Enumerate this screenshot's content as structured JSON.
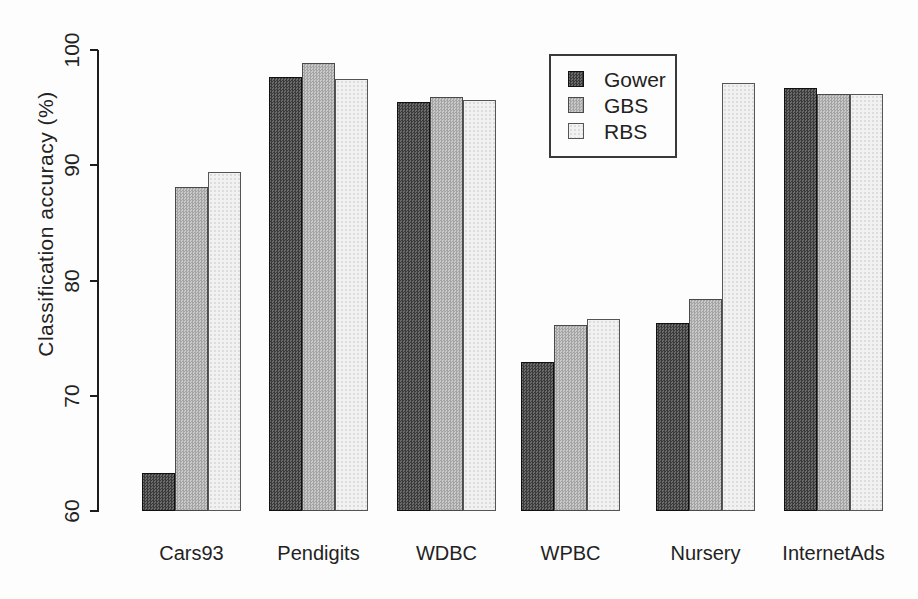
{
  "chart_data": {
    "type": "bar",
    "title": "",
    "xlabel": "",
    "ylabel": "Classification accuracy (%)",
    "ylim": [
      60,
      100
    ],
    "yticks": [
      60,
      70,
      80,
      90,
      100
    ],
    "grid": false,
    "legend_position": "top-right-inside",
    "categories": [
      "Cars93",
      "Pendigits",
      "WDBC",
      "WPBC",
      "Nursery",
      "InternetAds"
    ],
    "series": [
      {
        "name": "Gower",
        "values": [
          63.3,
          97.7,
          95.5,
          72.9,
          76.3,
          96.7
        ]
      },
      {
        "name": "GBS",
        "values": [
          88.1,
          98.9,
          95.9,
          76.1,
          78.4,
          96.2
        ]
      },
      {
        "name": "RBS",
        "values": [
          89.4,
          97.5,
          95.7,
          76.7,
          97.1,
          96.2
        ]
      }
    ],
    "colors": {
      "gower": "#4f4f4f",
      "gbs": "#b6b6b6",
      "rbs": "#f1f1f1",
      "axis": "#1c1c1c",
      "background": "#fdfdfd"
    }
  }
}
